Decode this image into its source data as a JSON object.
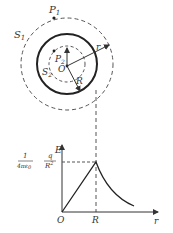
{
  "diagram": {
    "labels": {
      "P1": "P",
      "P1_sub": "1",
      "P2": "P",
      "P2_sub": "2",
      "S1": "S",
      "S1_sub": "1",
      "S2": "S",
      "S2_sub": "2",
      "O": "O",
      "r": "r",
      "R": "R"
    },
    "graph": {
      "y_axis": "E",
      "x_axis": "r",
      "origin": "O",
      "x_tick": "R",
      "peak_coef_num": "1",
      "peak_coef_den": "4πε",
      "peak_coef_den_sub": "0",
      "peak_q": "q",
      "peak_R2": "R",
      "peak_R2_exp": "2"
    }
  }
}
